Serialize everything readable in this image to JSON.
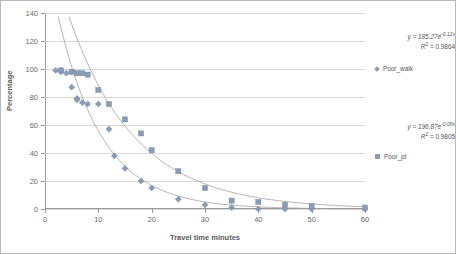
{
  "chart_data": {
    "type": "scatter",
    "title": "",
    "xlabel": "Travel time minutes",
    "ylabel": "Percentage",
    "xlim": [
      0,
      60
    ],
    "ylim": [
      0,
      140
    ],
    "xticks": [
      0,
      10,
      20,
      30,
      40,
      50,
      60
    ],
    "yticks": [
      0,
      20,
      40,
      60,
      80,
      100,
      120,
      140
    ],
    "grid": "horizontal",
    "legend_position": "right",
    "series": [
      {
        "name": "Poor_walk",
        "marker": "diamond",
        "color": "#8a9bb4",
        "equation": "y = 185.27e",
        "equation_exponent": "-0.12x",
        "r_squared_label": "R",
        "r_squared_value": " = 0.9864",
        "fit_a": 185.27,
        "fit_b": -0.12,
        "r2": 0.9864,
        "x": [
          2,
          3,
          3,
          4,
          5,
          5,
          6,
          6,
          7,
          8,
          10,
          12,
          13,
          15,
          18,
          20,
          25,
          30,
          35,
          40,
          45,
          50,
          60
        ],
        "y": [
          99,
          99,
          98,
          97,
          98,
          87,
          79,
          78,
          76,
          75,
          75,
          57,
          38,
          29,
          20,
          15,
          7,
          3,
          1,
          0,
          0,
          0,
          0
        ]
      },
      {
        "name": "Poor_pt",
        "marker": "square",
        "color": "#8a9bb4",
        "equation": "y = 196.87e",
        "equation_exponent": "-0.08x",
        "r_squared_label": "R",
        "r_squared_value": " = 0.9805",
        "fit_a": 196.87,
        "fit_b": -0.08,
        "r2": 0.9805,
        "x": [
          3,
          5,
          6,
          7,
          8,
          10,
          12,
          15,
          18,
          20,
          25,
          30,
          35,
          40,
          45,
          50,
          60
        ],
        "y": [
          99,
          98,
          97,
          97,
          96,
          85,
          75,
          64,
          54,
          42,
          27,
          15,
          6,
          5,
          3,
          2,
          1
        ]
      }
    ]
  },
  "annotations": {
    "walk": {
      "eq_prefix": "y = 185.27e",
      "eq_exp": "-0.12x",
      "r2_prefix": "R",
      "r2_sup": "2",
      "r2_value": " = 0.9864"
    },
    "pt": {
      "eq_prefix": "y = 196.87e",
      "eq_exp": "-0.08x",
      "r2_prefix": "R",
      "r2_sup": "2",
      "r2_value": " = 0.9805"
    }
  },
  "legend": {
    "walk_label": "Poor_walk",
    "pt_label": "Poor_pt"
  }
}
